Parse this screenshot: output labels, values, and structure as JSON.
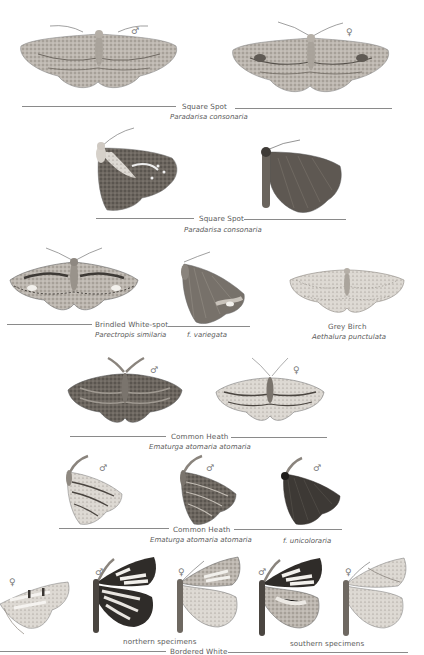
{
  "plate": {
    "groups": [
      {
        "id": "square-spot-spread",
        "common_name": "Square Spot",
        "scientific_name": "Paradarisa consonaria",
        "specimens": [
          {
            "sex": "♂",
            "pose": "spread"
          },
          {
            "sex": "♀",
            "pose": "spread"
          }
        ]
      },
      {
        "id": "square-spot-resting",
        "common_name": "Square Spot",
        "scientific_name": "Paradarisa consonaria",
        "specimens": [
          {
            "pose": "resting"
          },
          {
            "pose": "resting"
          }
        ]
      },
      {
        "id": "brindled-white-spot",
        "common_name": "Brindled White-spot",
        "scientific_name": "Parectropis similaria",
        "form_label": "f. variegata",
        "specimens": [
          {
            "pose": "spread"
          },
          {
            "pose": "resting",
            "form": "f. variegata"
          }
        ]
      },
      {
        "id": "grey-birch",
        "common_name": "Grey Birch",
        "scientific_name": "Aethalura punctulata",
        "specimens": [
          {
            "pose": "spread"
          }
        ]
      },
      {
        "id": "common-heath-spread",
        "common_name": "Common Heath",
        "scientific_name": "Ematurga atomaria atomaria",
        "specimens": [
          {
            "sex": "♂",
            "pose": "spread"
          },
          {
            "sex": "♀",
            "pose": "spread"
          }
        ]
      },
      {
        "id": "common-heath-resting",
        "common_name": "Common Heath",
        "scientific_name": "Ematurga atomaria atomaria",
        "form_label": "f. unicoloraria",
        "specimens": [
          {
            "sex": "♂",
            "pose": "resting"
          },
          {
            "sex": "♂",
            "pose": "resting"
          },
          {
            "sex": "♂",
            "pose": "resting",
            "form": "f. unicoloraria"
          }
        ]
      },
      {
        "id": "bordered-white",
        "common_name": "Bordered White",
        "sublabels": [
          "northern specimens",
          "southern specimens"
        ],
        "specimens": [
          {
            "sex": "♀",
            "pose": "resting"
          },
          {
            "sex": "♂",
            "pose": "resting",
            "region": "northern"
          },
          {
            "sex": "♀",
            "pose": "resting",
            "region": "northern"
          },
          {
            "sex": "♂",
            "pose": "resting",
            "region": "southern"
          },
          {
            "sex": "♀",
            "pose": "resting",
            "region": "southern"
          }
        ]
      }
    ]
  },
  "labels": {
    "g1_name": "Square Spot",
    "g1_sci": "Paradarisa consonaria",
    "g1_male": "♂",
    "g1_female": "♀",
    "g2_name": "Square Spot",
    "g2_sci": "Paradarisa consonaria",
    "g3_name": "Brindled White-spot",
    "g3_sci": "Parectropis similaria",
    "g3_form": "f. variegata",
    "g4_name": "Grey Birch",
    "g4_sci": "Aethalura punctulata",
    "g5_name": "Common Heath",
    "g5_sci": "Ematurga atomaria atomaria",
    "g5_male": "♂",
    "g5_female": "♀",
    "g6_name": "Common Heath",
    "g6_sci": "Ematurga atomaria atomaria",
    "g6_form": "f. unicoloraria",
    "g6_sex1": "♂",
    "g6_sex2": "♂",
    "g6_sex3": "♂",
    "g7_name": "Bordered White",
    "g7_north": "northern specimens",
    "g7_south": "southern specimens",
    "g7_sex1": "♀",
    "g7_sex2": "♂",
    "g7_sex3": "♀",
    "g7_sex4": "♂",
    "g7_sex5": "♀"
  },
  "colors": {
    "background": "#ffffff",
    "text": "#5a5a5a",
    "rule": "#8a8a8a",
    "moth_light": "#c9c4bd",
    "moth_mid": "#9a948d",
    "moth_dark": "#4a4540"
  }
}
